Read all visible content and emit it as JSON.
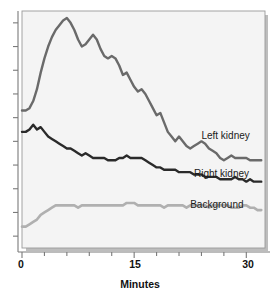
{
  "chart_data": {
    "type": "line",
    "title": "",
    "subtitle": "",
    "xlabel": "Minutes",
    "ylabel": "",
    "xlim": [
      0,
      32.5
    ],
    "ylim": [
      0,
      100
    ],
    "grid": false,
    "legend_position": "inline-right",
    "x_ticks_major": [
      0,
      15,
      30
    ],
    "x_tick_labels": [
      "0",
      "15",
      "30"
    ],
    "x_ticks_minor": [
      3,
      6,
      9,
      12,
      18,
      21,
      24,
      27
    ],
    "y_ticks": [
      5,
      15,
      25,
      35,
      45,
      55,
      65,
      75,
      85,
      95
    ],
    "y_tick_labels": [],
    "x": [
      0,
      0.5,
      1,
      1.5,
      2,
      2.5,
      3,
      3.5,
      4,
      4.5,
      5,
      5.5,
      6,
      6.5,
      7,
      7.5,
      8,
      8.5,
      9,
      9.5,
      10,
      10.5,
      11,
      11.5,
      12,
      12.5,
      13,
      13.5,
      14,
      14.5,
      15,
      15.5,
      16,
      16.5,
      17,
      17.5,
      18,
      18.5,
      19,
      19.5,
      20,
      20.5,
      21,
      21.5,
      22,
      22.5,
      23,
      23.5,
      24,
      24.5,
      25,
      25.5,
      26,
      26.5,
      27,
      27.5,
      28,
      28.5,
      29,
      29.5,
      30,
      30.5,
      31,
      31.5,
      32
    ],
    "series": [
      {
        "name": "Left kidney",
        "color": "#6a6a6a",
        "label_x": 24.0,
        "label_y": 46.0,
        "values": [
          58,
          58,
          59,
          62,
          67,
          74,
          80,
          85,
          89,
          92,
          94,
          96,
          97,
          95,
          92,
          88,
          85,
          86,
          88,
          90,
          88,
          84,
          81,
          80,
          81,
          80,
          77,
          73,
          74,
          71,
          68,
          66,
          67,
          65,
          62,
          59,
          56,
          57,
          53,
          49,
          47,
          45,
          47,
          45,
          43,
          42,
          43,
          44,
          45,
          44,
          42,
          41,
          40,
          38,
          37,
          38,
          39,
          38,
          38,
          38,
          38,
          37,
          37,
          37,
          37
        ]
      },
      {
        "name": "Right kidney",
        "color": "#2a2a2a",
        "label_x": 23.0,
        "label_y": 30.0,
        "values": [
          49,
          49,
          50,
          52,
          50,
          51,
          49,
          47,
          46,
          45,
          44,
          43,
          42,
          42,
          41,
          40,
          39,
          40,
          39,
          38,
          38,
          38,
          38,
          37,
          37,
          37,
          38,
          38,
          39,
          38,
          38,
          38,
          38,
          37,
          36,
          35,
          34,
          34,
          33,
          33,
          33,
          33,
          32,
          32,
          32,
          32,
          31,
          31,
          31,
          30,
          30,
          30,
          30,
          29,
          29,
          29,
          29,
          30,
          29,
          29,
          28,
          29,
          28,
          28,
          28
        ]
      },
      {
        "name": "Background",
        "color": "#b0b0b0",
        "label_x": 22.5,
        "label_y": 17.0,
        "values": [
          9,
          9,
          10,
          11,
          12,
          14,
          15,
          16,
          17,
          18,
          18,
          18,
          18,
          18,
          18,
          17,
          18,
          18,
          18,
          18,
          18,
          18,
          18,
          18,
          18,
          18,
          18,
          18,
          19,
          19,
          19,
          18,
          18,
          18,
          18,
          18,
          18,
          18,
          17,
          18,
          18,
          18,
          18,
          18,
          17,
          18,
          18,
          18,
          18,
          18,
          17,
          18,
          18,
          18,
          18,
          18,
          17,
          17,
          17,
          18,
          18,
          17,
          17,
          16,
          16
        ]
      }
    ]
  },
  "axis": {
    "x_label_0": "0",
    "x_label_15": "15",
    "x_label_30": "30",
    "x_title": "Minutes"
  },
  "labels": {
    "left_kidney": "Left kidney",
    "right_kidney": "Right kidney",
    "background": "Background"
  },
  "colors": {
    "left_kidney": "#6a6a6a",
    "right_kidney": "#2a2a2a",
    "background_series": "#b0b0b0",
    "plot_fill": "#f4f4f4",
    "plot_border": "#9a9a9a",
    "axis": "#7a7a7a",
    "text": "#111111",
    "page": "#ffffff"
  }
}
